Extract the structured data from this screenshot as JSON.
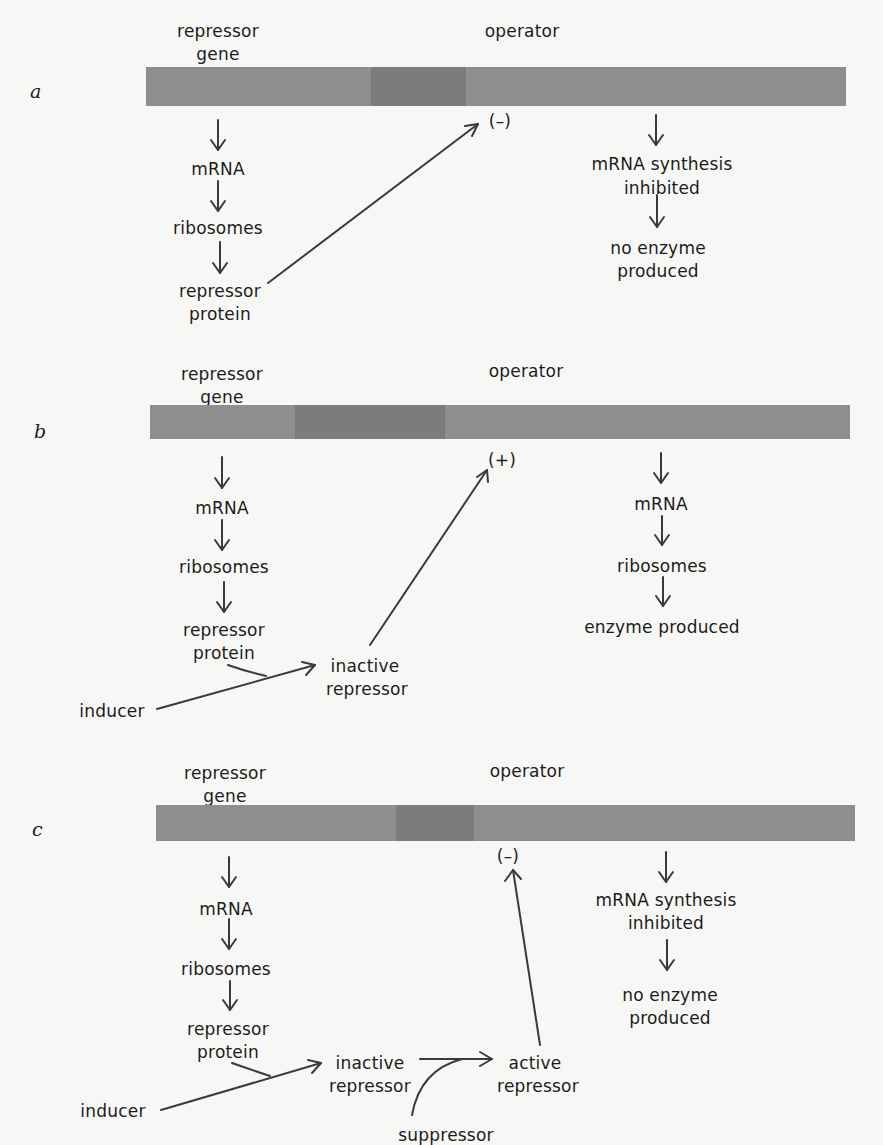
{
  "figure": {
    "panels": [
      {
        "letter": "a",
        "gene_label_1": "repressor",
        "gene_label_2": "gene",
        "operator_label": "operator",
        "left_chain": [
          "mRNA",
          "ribosomes"
        ],
        "protein_1": "repressor",
        "protein_2": "protein",
        "operator_sign": "(–)",
        "right_1a": "mRNA synthesis",
        "right_1b": "inhibited",
        "right_2a": "no enzyme",
        "right_2b": "produced"
      },
      {
        "letter": "b",
        "gene_label_1": "repressor",
        "gene_label_2": "gene",
        "operator_label": "operator",
        "left_chain": [
          "mRNA",
          "ribosomes"
        ],
        "protein_1": "repressor",
        "protein_2": "protein",
        "inducer": "inducer",
        "inactive_1": "inactive",
        "inactive_2": "repressor",
        "operator_sign": "(+)",
        "right_chain": [
          "mRNA",
          "ribosomes",
          "enzyme produced"
        ]
      },
      {
        "letter": "c",
        "gene_label_1": "repressor",
        "gene_label_2": "gene",
        "operator_label": "operator",
        "left_chain": [
          "mRNA",
          "ribosomes"
        ],
        "protein_1": "repressor",
        "protein_2": "protein",
        "inducer": "inducer",
        "inactive_1": "inactive",
        "inactive_2": "repressor",
        "active_1": "active",
        "active_2": "repressor",
        "suppressor": "suppressor",
        "operator_sign": "(–)",
        "right_1a": "mRNA synthesis",
        "right_1b": "inhibited",
        "right_2a": "no enzyme",
        "right_2b": "produced"
      }
    ],
    "colors": {
      "background": "#f7f7f5",
      "dna_bar": "#8e8e8e",
      "operator_region": "#7c7c7c",
      "ink": "#1c1c1c"
    }
  }
}
